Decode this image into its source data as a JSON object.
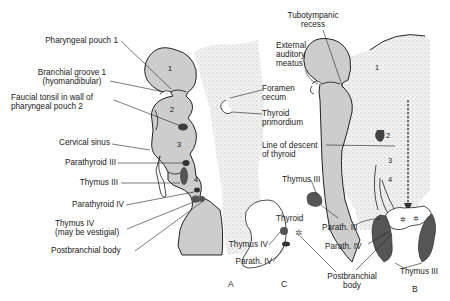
{
  "figure": {
    "panels": {
      "a": "A",
      "b": "B",
      "c": "C"
    },
    "pouch_numbers": {
      "p1": "1",
      "p2": "2",
      "p3": "3",
      "p4": "4",
      "b1": "1",
      "b2": "2",
      "b3": "3",
      "b4": "4"
    },
    "labels_a": {
      "pharyngeal_pouch_1": "Pharyngeal pouch 1",
      "branchial_groove_1": "Branchial groove 1",
      "branchial_groove_1_sub": "(hyomandibular)",
      "faucial_tonsil_1": "Faucial tonsil in wall of",
      "faucial_tonsil_2": "pharyngeal pouch 2",
      "cervical_sinus": "Cervical sinus",
      "parathyroid_iii": "Parathyroid III",
      "thymus_iii": "Thymus III",
      "parathyroid_iv": "Parathyroid IV",
      "thymus_iv": "Thymus IV",
      "thymus_iv_sub": "(may be vestigial)",
      "postbranchial_body": "Postbranchial body"
    },
    "labels_mid": {
      "tubotympanic_1": "Tubotympanic",
      "tubotympanic_2": "recess",
      "external_1": "External",
      "external_2": "auditory",
      "external_3": "meatus",
      "foramen_1": "Foramen",
      "foramen_2": "cecum",
      "thyroid_prim_1": "Thyroid",
      "thyroid_prim_2": "primordium",
      "descent_1": "Line of descent",
      "descent_2": "of thyroid"
    },
    "labels_c": {
      "thymus_iii": "Thymus III",
      "thyroid": "Thyroid",
      "thymus_iv": "Thymus IV",
      "parath_iv": "Parath. IV",
      "parath_iii": "Parath. III",
      "parath_iv_b": "Parath. IV",
      "postbranchial_1": "Postbranchial",
      "postbranchial_2": "body"
    },
    "labels_b": {
      "thymus_iii": "Thymus III"
    },
    "colors": {
      "tissue": "#c9c9c9",
      "stipple": "#d8d8d8",
      "dark_gland": "#4a4a4a",
      "outline": "#222222"
    }
  }
}
